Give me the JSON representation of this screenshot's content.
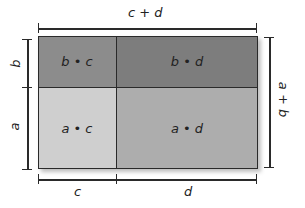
{
  "diagram": {
    "top_label": "c + d",
    "right_label": "a + b",
    "left_labels": [
      "b",
      "a"
    ],
    "bottom_labels": [
      "c",
      "d"
    ],
    "cells": {
      "bc": {
        "label": "b • c",
        "color": "#8c8c8c"
      },
      "bd": {
        "label": "b • d",
        "color": "#7d7d7d"
      },
      "ac": {
        "label": "a • c",
        "color": "#cfcfcf"
      },
      "ad": {
        "label": "a • d",
        "color": "#adadad"
      }
    }
  }
}
